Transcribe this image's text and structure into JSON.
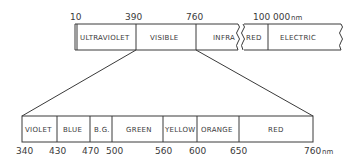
{
  "diagram": {
    "unit": "nm",
    "top_bar": {
      "ticks": [
        "10",
        "390",
        "760",
        "100 000"
      ],
      "unit_label": "nm",
      "segments": [
        {
          "label": "ULTRAVIOLET"
        },
        {
          "label": "VISIBLE"
        },
        {
          "label": "INFRA"
        },
        {
          "label": "RED"
        },
        {
          "label": "ELECTRIC"
        }
      ]
    },
    "bottom_bar": {
      "ticks": [
        "340",
        "430",
        "470",
        "500",
        "560",
        "600",
        "650",
        "760"
      ],
      "unit_label": "nm",
      "segments": [
        {
          "label": "VIOLET",
          "from": 340,
          "to": 430
        },
        {
          "label": "BLUE",
          "from": 430,
          "to": 470
        },
        {
          "label": "B.G.",
          "from": 470,
          "to": 500
        },
        {
          "label": "GREEN",
          "from": 500,
          "to": 560
        },
        {
          "label": "YELLOW",
          "from": 560,
          "to": 600
        },
        {
          "label": "ORANGE",
          "from": 600,
          "to": 650
        },
        {
          "label": "RED",
          "from": 650,
          "to": 760
        }
      ]
    }
  }
}
